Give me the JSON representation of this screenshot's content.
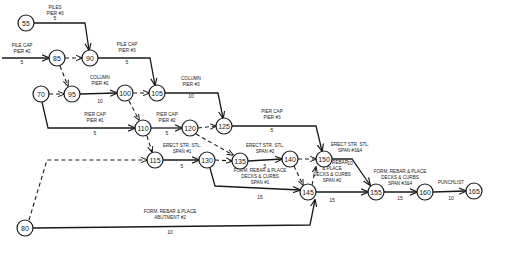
{
  "diagram": {
    "type": "activity-on-arrow network",
    "nodes": [
      "55",
      "65",
      "70",
      "80",
      "85",
      "90",
      "95",
      "100",
      "105",
      "110",
      "115",
      "120",
      "125",
      "130",
      "135",
      "140",
      "145",
      "150",
      "155",
      "160",
      "165"
    ],
    "activities": [
      {
        "id": "a1",
        "from": "55",
        "to": "90",
        "label": [
          "PILES",
          "PIER #3"
        ],
        "duration": "5"
      },
      {
        "id": "a2",
        "from": "start",
        "to": "85",
        "label": [
          "PILE CAP",
          "PIER #2"
        ],
        "duration": "5"
      },
      {
        "id": "a3",
        "from": "90",
        "to": "105",
        "label": [
          "PILE CAP",
          "PIER #3"
        ],
        "duration": "5"
      },
      {
        "id": "a4",
        "from": "95",
        "to": "100",
        "label": [
          "COLUMN",
          "PIER #2"
        ],
        "duration": "10"
      },
      {
        "id": "a5",
        "from": "105",
        "to": "125",
        "label": [
          "COLUMN",
          "PIER #3"
        ],
        "duration": "10"
      },
      {
        "id": "a6",
        "from": "70",
        "to": "110",
        "label": [
          "PIER CAP",
          "PIER #1"
        ],
        "duration": "5"
      },
      {
        "id": "a7",
        "from": "110",
        "to": "120",
        "label": [
          "PIER CAP",
          "PIER #2"
        ],
        "duration": "5"
      },
      {
        "id": "a8",
        "from": "125",
        "to": "150",
        "label": [
          "PIER CAP",
          "PIER #3"
        ],
        "duration": "5"
      },
      {
        "id": "a9",
        "from": "115",
        "to": "130",
        "label": [
          "ERECT STR. STL.",
          "SPAN #1"
        ],
        "duration": "5"
      },
      {
        "id": "a10",
        "from": "135",
        "to": "140",
        "label": [
          "ERECT STR. STL.",
          "SPAN #2"
        ],
        "duration": "5"
      },
      {
        "id": "a11",
        "from": "150",
        "to": "155",
        "label": [
          "ERECT STR. STL.",
          "SPAN #3&4"
        ],
        "duration": "10"
      },
      {
        "id": "a12",
        "from": "130",
        "to": "145",
        "label": [
          "FORM, REBAR & PLACE",
          "DECKS & CURBS",
          "SPAN #1"
        ],
        "duration": "15"
      },
      {
        "id": "a13",
        "from": "145",
        "to": "155",
        "label": [
          "FORM, REBAR",
          "& PLACE",
          "DECKS & CURBS",
          "SPAN #2"
        ],
        "duration": "15"
      },
      {
        "id": "a14",
        "from": "155",
        "to": "160",
        "label": [
          "FORM, REBAR & PLACE",
          "DECKS & CURBS",
          "SPAN #3&4"
        ],
        "duration": "15"
      },
      {
        "id": "a15",
        "from": "160",
        "to": "165",
        "label": [
          "PUNCHLIST"
        ],
        "duration": "10"
      },
      {
        "id": "a16",
        "from": "80",
        "to": "145",
        "label": [
          "FORM, REBAR & PLACE",
          "ABUTMENT #2"
        ],
        "duration": "10"
      }
    ],
    "dummies": [
      [
        "85",
        "90"
      ],
      [
        "85",
        "95"
      ],
      [
        "70",
        "95"
      ],
      [
        "100",
        "105"
      ],
      [
        "100",
        "110"
      ],
      [
        "110",
        "115"
      ],
      [
        "120",
        "125"
      ],
      [
        "120",
        "135"
      ],
      [
        "130",
        "135"
      ],
      [
        "140",
        "150"
      ],
      [
        "140",
        "145"
      ],
      [
        "80",
        "115"
      ],
      [
        "145",
        "150"
      ]
    ]
  }
}
